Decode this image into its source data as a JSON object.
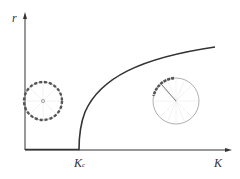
{
  "diagram": {
    "y_axis_label": "r",
    "x_axis_label": "K",
    "critical_label": "K",
    "critical_sub": "c",
    "annotations": {
      "left_circle": "incoherent state: oscillators spread uniformly around unit circle, r≈0",
      "right_circle": "partially synchronized state: oscillators clustered, order parameter arrow"
    },
    "colors": {
      "axis": "#333333",
      "curve": "#333333",
      "circle": "#888888",
      "dots": "#555555"
    }
  }
}
